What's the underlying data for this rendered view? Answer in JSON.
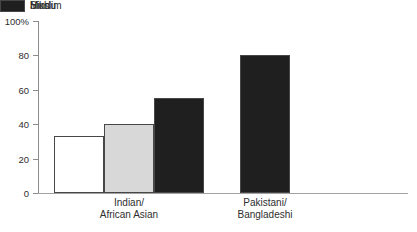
{
  "chart_data": {
    "type": "bar",
    "title": "",
    "categories": [
      "Indian/\nAfrican Asian",
      "Pakistani/\nBangladeshi"
    ],
    "series": [
      {
        "name": "Hindu",
        "color": "#ffffff",
        "values": [
          33,
          null
        ]
      },
      {
        "name": "Sikh",
        "color": "#d8d8d8",
        "values": [
          40,
          null
        ]
      },
      {
        "name": "Muslim",
        "color": "#1f1f1f",
        "values": [
          55,
          80
        ]
      }
    ],
    "xlabel": "",
    "ylabel": "",
    "ylim": [
      0,
      100
    ],
    "yticks": [
      0,
      20,
      40,
      60,
      80,
      100
    ],
    "ytick_labels": [
      "0",
      "20",
      "40",
      "60",
      "80",
      "100%"
    ],
    "grid": false,
    "legend_position": "top-right"
  },
  "colors": {
    "axis_y": "#8c8c8c",
    "axis_x": "#a2a2a2",
    "bar_border": "#474747",
    "text": "#2e2e2e"
  }
}
